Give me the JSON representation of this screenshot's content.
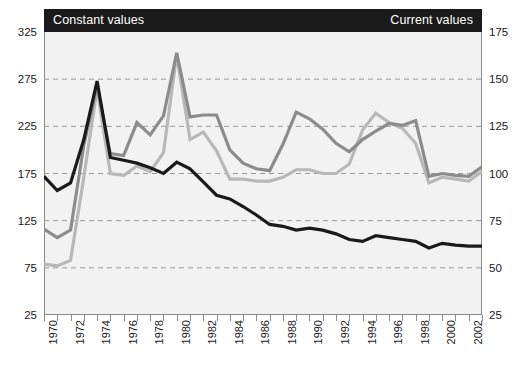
{
  "header": {
    "left_label": "Constant values",
    "right_label": "Current values"
  },
  "chart_data": {
    "type": "line",
    "title": "",
    "subtitle": "",
    "xlabel": "",
    "ylabel": "",
    "grid": true,
    "legend_position": "none",
    "x": [
      1970,
      1971,
      1972,
      1973,
      1974,
      1975,
      1976,
      1977,
      1978,
      1979,
      1980,
      1981,
      1982,
      1983,
      1984,
      1985,
      1986,
      1987,
      1988,
      1989,
      1990,
      1991,
      1992,
      1993,
      1994,
      1995,
      1996,
      1997,
      1998,
      1999,
      2000,
      2001,
      2002,
      2003
    ],
    "xtick_labels": [
      "1970",
      "1972",
      "1974",
      "1976",
      "1978",
      "1980",
      "1982",
      "1984",
      "1986",
      "1988",
      "1990",
      "1992",
      "1994",
      "1996",
      "1998",
      "2000",
      "2002"
    ],
    "xlim": [
      1970,
      2003
    ],
    "left_axis": {
      "label": "Constant values",
      "ylim": [
        25,
        325
      ],
      "ticks": [
        325,
        275,
        225,
        175,
        125,
        75,
        25
      ],
      "tick_labels": [
        "325",
        "275",
        "225",
        "175",
        "125",
        "75",
        "25"
      ]
    },
    "right_axis": {
      "label": "Current values",
      "ylim": [
        25,
        175
      ],
      "ticks": [
        175,
        150,
        125,
        100,
        75,
        50,
        25
      ],
      "tick_labels": [
        "175",
        "150",
        "125",
        "100",
        "75",
        "50",
        "25"
      ]
    },
    "gridlines_left": [
      275,
      225,
      175,
      125,
      75
    ],
    "series": [
      {
        "name": "Constant values - series 1",
        "axis": "left",
        "color": "#1a1a1a",
        "values": [
          172,
          157,
          165,
          211,
          273,
          192,
          189,
          186,
          181,
          175,
          187,
          180,
          166,
          152,
          148,
          140,
          131,
          121,
          119,
          115,
          117,
          115,
          111,
          105,
          103,
          109,
          107,
          105,
          103,
          96,
          101,
          99,
          98,
          98
        ]
      },
      {
        "name": "Constant values - series 2",
        "axis": "left",
        "color": "#8c8c8c",
        "values": [
          116,
          107,
          115,
          205,
          268,
          196,
          194,
          229,
          216,
          236,
          303,
          235,
          237,
          237,
          200,
          186,
          180,
          178,
          206,
          240,
          233,
          222,
          207,
          198,
          211,
          220,
          228,
          226,
          231,
          172,
          175,
          173,
          172,
          182
        ]
      },
      {
        "name": "Current values",
        "axis": "right",
        "color": "#b8b8b8",
        "values": [
          52,
          51,
          54,
          98,
          145,
          100,
          99,
          104,
          101,
          111,
          163,
          118,
          122,
          112,
          97,
          97,
          96,
          96,
          98,
          102,
          102,
          100,
          100,
          105,
          123,
          132,
          127,
          124,
          116,
          95,
          98,
          97,
          96,
          101
        ]
      }
    ]
  }
}
